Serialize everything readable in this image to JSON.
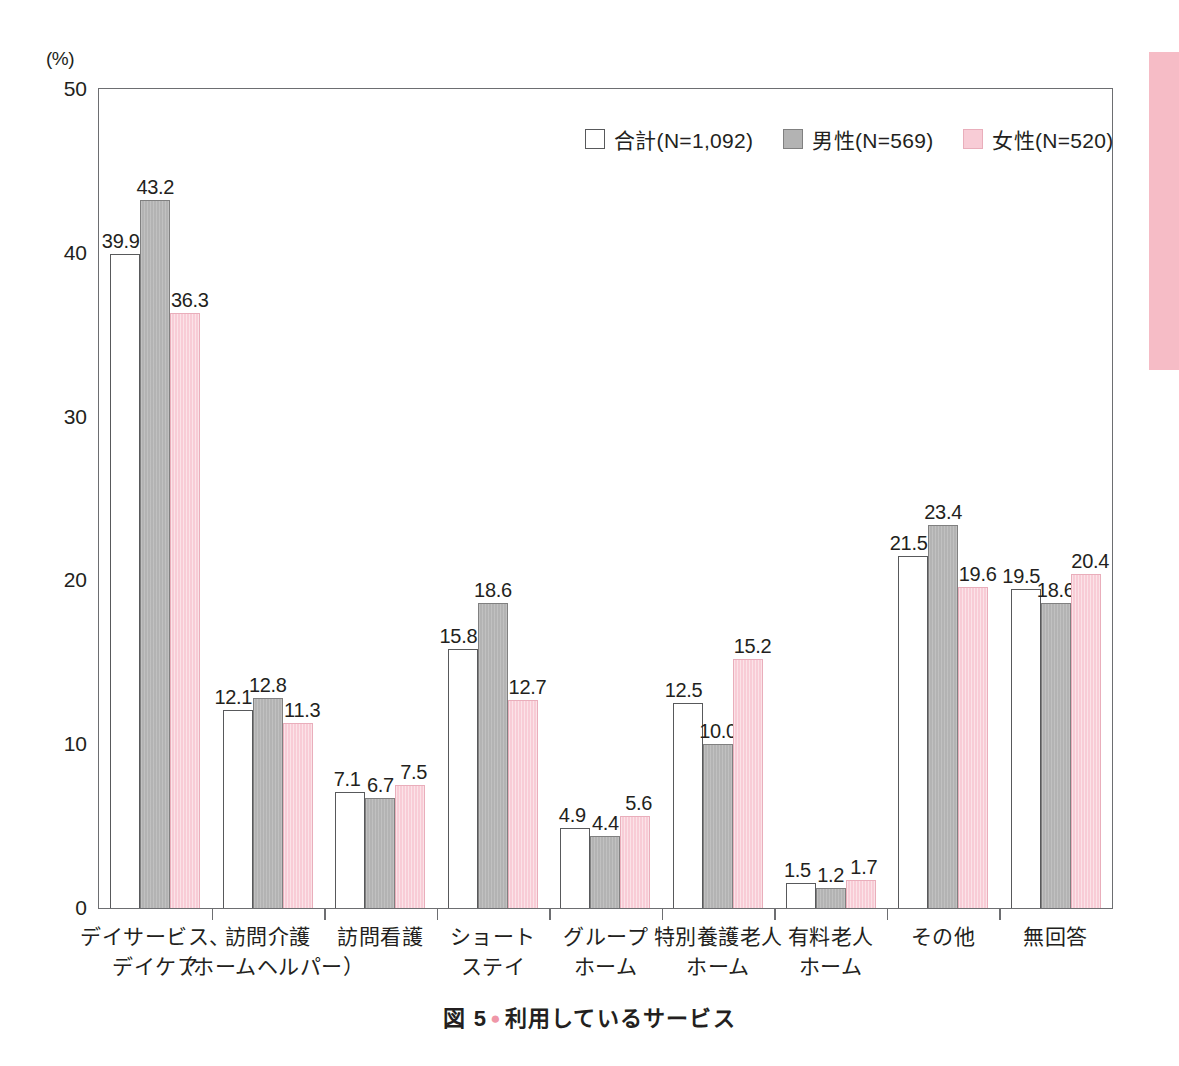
{
  "caption": {
    "prefix": "図 5",
    "bullet": "●",
    "title": "利用しているサービス"
  },
  "axis": {
    "y_unit": "(%)",
    "y_ticks": [
      "50",
      "40",
      "30",
      "20",
      "10",
      "0"
    ],
    "y_min": 0,
    "y_max": 50
  },
  "legend": [
    {
      "key": "total",
      "label": "合計(N=1,092)",
      "color": "#ffffff"
    },
    {
      "key": "male",
      "label": "男性(N=569)",
      "color": "#b3b3b3"
    },
    {
      "key": "female",
      "label": "女性(N=520)",
      "color": "#f8ccd6"
    }
  ],
  "chart_data": {
    "type": "bar",
    "title": "利用しているサービス",
    "xlabel": "",
    "ylabel": "(%)",
    "ylim": [
      0,
      50
    ],
    "yticks": [
      0,
      10,
      20,
      30,
      40,
      50
    ],
    "grid": false,
    "legend_position": "top-right",
    "categories": [
      "デイサービス、デイケア",
      "訪問介護(ホームヘルパー)",
      "訪問看護",
      "ショートステイ",
      "グループホーム",
      "特別養護老人ホーム",
      "有料老人ホーム",
      "その他",
      "無回答"
    ],
    "category_lines": [
      [
        "デイサービス、",
        "デイケア"
      ],
      [
        "訪問介護",
        "（ホームヘルパー）"
      ],
      [
        "訪問看護",
        ""
      ],
      [
        "ショート",
        "ステイ"
      ],
      [
        "グループ",
        "ホーム"
      ],
      [
        "特別養護老人",
        "ホーム"
      ],
      [
        "有料老人",
        "ホーム"
      ],
      [
        "その他",
        ""
      ],
      [
        "無回答",
        ""
      ]
    ],
    "series": [
      {
        "name": "合計(N=1,092)",
        "key": "total",
        "values": [
          39.9,
          12.1,
          7.1,
          15.8,
          4.9,
          12.5,
          1.5,
          21.5,
          19.5
        ]
      },
      {
        "name": "男性(N=569)",
        "key": "male",
        "values": [
          43.2,
          12.8,
          6.7,
          18.6,
          4.4,
          10.0,
          1.2,
          23.4,
          18.6
        ]
      },
      {
        "name": "女性(N=520)",
        "key": "female",
        "values": [
          36.3,
          11.3,
          7.5,
          12.7,
          5.6,
          15.2,
          1.7,
          19.6,
          20.4
        ]
      }
    ],
    "value_labels": [
      [
        "39.9",
        "43.2",
        "36.3"
      ],
      [
        "12.1",
        "12.8",
        "11.3"
      ],
      [
        "7.1",
        "6.7",
        "7.5"
      ],
      [
        "15.8",
        "18.6",
        "12.7"
      ],
      [
        "4.9",
        "4.4",
        "5.6"
      ],
      [
        "12.5",
        "10.0",
        "15.2"
      ],
      [
        "1.5",
        "1.2",
        "1.7"
      ],
      [
        "21.5",
        "23.4",
        "19.6"
      ],
      [
        "19.5",
        "18.6",
        "20.4"
      ]
    ]
  },
  "colors": {
    "total_fill": "#ffffff",
    "male_fill": "#b3b3b3",
    "female_fill": "#f8ccd6",
    "frame": "#6d6e71",
    "text": "#231f20",
    "edge_marker": "#f6bcc6",
    "caption_bullet": "#ef97a8"
  }
}
